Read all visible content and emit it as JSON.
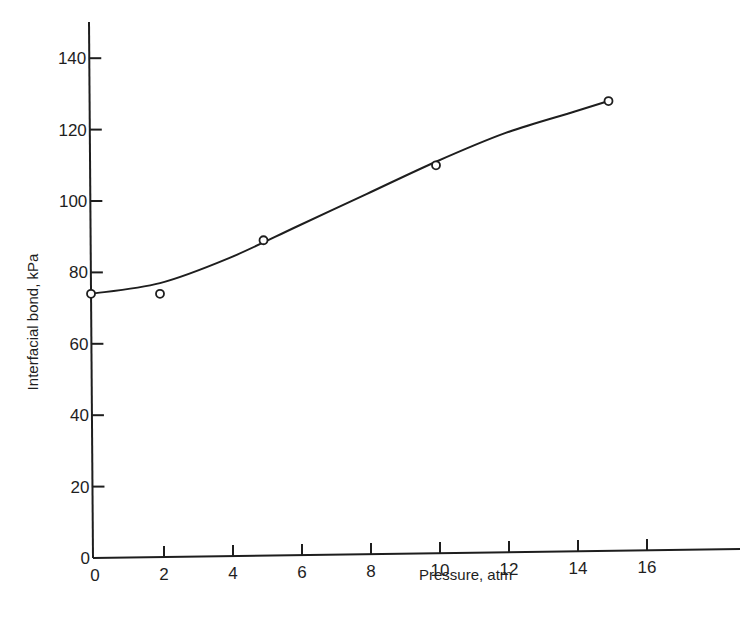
{
  "chart_data": {
    "type": "line",
    "title": "",
    "xlabel": "Pressure, atm",
    "ylabel": "Interfacial bond, kPa",
    "xlim": [
      0,
      18
    ],
    "ylim": [
      0,
      150
    ],
    "x_ticks": [
      0,
      2,
      4,
      6,
      8,
      10,
      12,
      14,
      16
    ],
    "x_tick_labels": [
      "0",
      "2",
      "4",
      "6",
      "8",
      "10",
      "12",
      "14",
      "16"
    ],
    "y_ticks": [
      0,
      20,
      40,
      60,
      80,
      100,
      120,
      140
    ],
    "y_tick_labels": [
      "0",
      "20",
      "40",
      "60",
      "80",
      "100",
      "120",
      "140"
    ],
    "grid": false,
    "legend": null,
    "series": [
      {
        "name": "Measured",
        "style": "open-circle markers",
        "x": [
          0,
          2,
          5,
          10,
          15
        ],
        "y": [
          74,
          74,
          89,
          110,
          128
        ]
      },
      {
        "name": "Fitted curve",
        "style": "smooth solid line",
        "x": [
          0,
          2,
          4,
          6,
          8,
          10,
          12,
          14,
          15
        ],
        "y": [
          74,
          77,
          84,
          93,
          102,
          111,
          119,
          125,
          128
        ]
      }
    ]
  },
  "colors": {
    "ink": "#1e1e1e",
    "background": "#ffffff"
  }
}
